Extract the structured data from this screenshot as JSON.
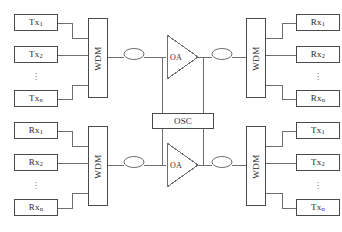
{
  "figure": {
    "type": "block-diagram",
    "domain": "optical-wdm-network",
    "background_color": "#ffffff",
    "line_color": "#6e6e6e",
    "box_border_color": "#4a4a4a",
    "text_color": "#2b2b2b"
  },
  "groups": {
    "top_left": {
      "name": "transmitter-bank-west",
      "terminals": [
        {
          "prefix": "Tx",
          "sub": "1"
        },
        {
          "prefix": "Tx",
          "sub": "2"
        },
        {
          "prefix": "Tx",
          "sub": "n"
        }
      ],
      "ellipsis": "⋮",
      "mux_label": "WDM"
    },
    "bottom_left": {
      "name": "receiver-bank-west",
      "terminals": [
        {
          "prefix": "Rx",
          "sub": "1"
        },
        {
          "prefix": "Rx",
          "sub": "2"
        },
        {
          "prefix": "Rx",
          "sub": "n"
        }
      ],
      "ellipsis": "⋮",
      "mux_label": "WDM"
    },
    "top_right": {
      "name": "receiver-bank-east",
      "terminals": [
        {
          "prefix": "Rx",
          "sub": "1"
        },
        {
          "prefix": "Rx",
          "sub": "2"
        },
        {
          "prefix": "Rx",
          "sub": "n"
        }
      ],
      "ellipsis": "⋮",
      "mux_label": "WDM"
    },
    "bottom_right": {
      "name": "transmitter-bank-east",
      "terminals": [
        {
          "prefix": "Tx",
          "sub": "1"
        },
        {
          "prefix": "Tx",
          "sub": "2"
        },
        {
          "prefix": "Tx",
          "sub": "n"
        }
      ],
      "ellipsis": "⋮",
      "mux_label": "WDM"
    }
  },
  "amplifiers": [
    {
      "name": "optical-amplifier-upper",
      "label": "OA",
      "direction": "right"
    },
    {
      "name": "optical-amplifier-lower",
      "label": "OA",
      "direction": "right"
    }
  ],
  "supervisory": {
    "name": "optical-supervisory-channel",
    "label": "OSC"
  },
  "couplers": [
    {
      "name": "coupler-upper-west"
    },
    {
      "name": "coupler-upper-east"
    },
    {
      "name": "coupler-lower-west"
    },
    {
      "name": "coupler-lower-east"
    }
  ]
}
